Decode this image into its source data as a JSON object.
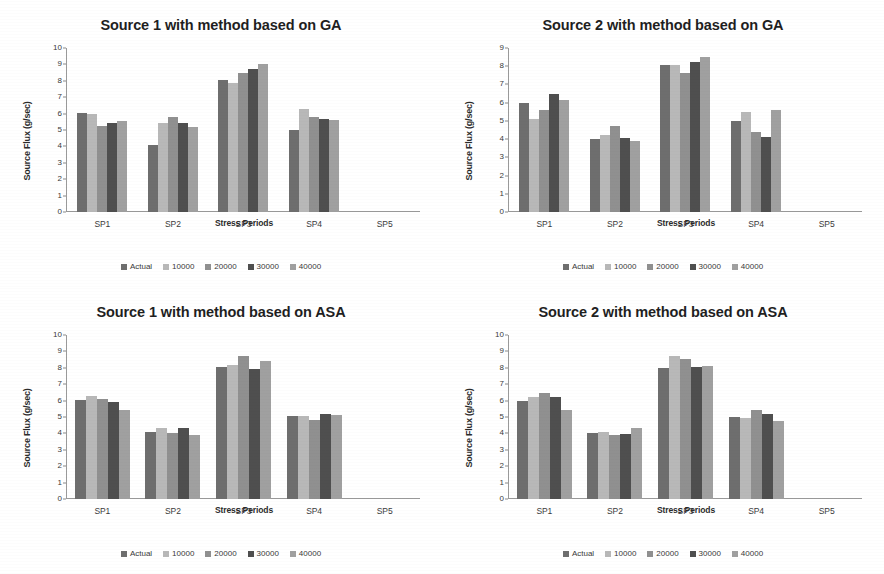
{
  "figure": {
    "series_colors": [
      "#6e6e6e",
      "#b8b8b8",
      "#909090",
      "#4f4f4f",
      "#a0a0a0"
    ],
    "series_names": [
      "Actual",
      "10000",
      "20000",
      "30000",
      "40000"
    ],
    "xlabel": "Stress Periods",
    "ylabel": "Source Flux (g/sec)",
    "categories": [
      "SP1",
      "SP2",
      "SP3",
      "SP4",
      "SP5"
    ]
  },
  "chart_data": [
    {
      "type": "bar",
      "title": "Source 1 with method based on GA",
      "xlabel": "Stress Periods",
      "ylabel": "Source Flux (g/sec)",
      "categories": [
        "SP1",
        "SP2",
        "SP3",
        "SP4",
        "SP5"
      ],
      "ylim": [
        0,
        10
      ],
      "yticks": [
        0,
        1,
        2,
        3,
        4,
        5,
        6,
        7,
        8,
        9,
        10
      ],
      "grid": false,
      "legend_position": "bottom",
      "bar_gap": true,
      "series": [
        {
          "name": "Actual",
          "values": [
            6.05,
            4.1,
            8.05,
            5.0,
            0
          ]
        },
        {
          "name": "10000",
          "values": [
            6.0,
            5.45,
            7.85,
            6.3,
            0
          ]
        },
        {
          "name": "20000",
          "values": [
            5.25,
            5.8,
            8.5,
            5.8,
            0
          ]
        },
        {
          "name": "30000",
          "values": [
            5.4,
            5.45,
            8.75,
            5.7,
            0
          ]
        },
        {
          "name": "40000",
          "values": [
            5.55,
            5.2,
            9.0,
            5.6,
            0
          ]
        }
      ]
    },
    {
      "type": "bar",
      "title": "Source 2 with method based on GA",
      "xlabel": "Stress Periods",
      "ylabel": "Source Flux (g/sec)",
      "categories": [
        "SP1",
        "SP2",
        "SP3",
        "SP4",
        "SP5"
      ],
      "ylim": [
        0,
        9
      ],
      "yticks": [
        0,
        1,
        2,
        3,
        4,
        5,
        6,
        7,
        8,
        9
      ],
      "grid": false,
      "legend_position": "bottom",
      "bar_gap": true,
      "series": [
        {
          "name": "Actual",
          "values": [
            6.0,
            4.0,
            8.05,
            5.0,
            0
          ]
        },
        {
          "name": "10000",
          "values": [
            5.1,
            4.25,
            8.05,
            5.5,
            0
          ]
        },
        {
          "name": "20000",
          "values": [
            5.6,
            4.7,
            7.65,
            4.4,
            0
          ]
        },
        {
          "name": "30000",
          "values": [
            6.45,
            4.05,
            8.25,
            4.1,
            0
          ]
        },
        {
          "name": "40000",
          "values": [
            6.15,
            3.9,
            8.5,
            5.6,
            0
          ]
        }
      ]
    },
    {
      "type": "bar",
      "title": "Source 1 with method based on ASA",
      "xlabel": "Stress Periods",
      "ylabel": "Source Flux (g/sec)",
      "categories": [
        "SP1",
        "SP2",
        "SP3",
        "SP4",
        "SP5"
      ],
      "ylim": [
        0,
        10
      ],
      "yticks": [
        0,
        1,
        2,
        3,
        4,
        5,
        6,
        7,
        8,
        9,
        10
      ],
      "grid": false,
      "legend_position": "bottom",
      "bar_gap": false,
      "series": [
        {
          "name": "Actual",
          "values": [
            6.05,
            4.1,
            8.05,
            5.05,
            0
          ]
        },
        {
          "name": "10000",
          "values": [
            6.3,
            4.3,
            8.15,
            5.05,
            0
          ]
        },
        {
          "name": "20000",
          "values": [
            6.1,
            4.05,
            8.75,
            4.8,
            0
          ]
        },
        {
          "name": "30000",
          "values": [
            5.9,
            4.3,
            7.95,
            5.2,
            0
          ]
        },
        {
          "name": "40000",
          "values": [
            5.45,
            3.9,
            8.4,
            5.1,
            0
          ]
        }
      ]
    },
    {
      "type": "bar",
      "title": "Source 2 with method based on ASA",
      "xlabel": "Stress Periods",
      "ylabel": "Source Flux (g/sec)",
      "categories": [
        "SP1",
        "SP2",
        "SP3",
        "SP4",
        "SP5"
      ],
      "ylim": [
        0,
        10
      ],
      "yticks": [
        0,
        1,
        2,
        3,
        4,
        5,
        6,
        7,
        8,
        9,
        10
      ],
      "grid": false,
      "legend_position": "bottom",
      "bar_gap": false,
      "series": [
        {
          "name": "Actual",
          "values": [
            6.0,
            4.0,
            8.0,
            5.0,
            0
          ]
        },
        {
          "name": "10000",
          "values": [
            6.2,
            4.1,
            8.7,
            4.95,
            0
          ]
        },
        {
          "name": "20000",
          "values": [
            6.45,
            3.9,
            8.55,
            5.4,
            0
          ]
        },
        {
          "name": "30000",
          "values": [
            6.25,
            3.95,
            8.05,
            5.2,
            0
          ]
        },
        {
          "name": "40000",
          "values": [
            5.4,
            4.3,
            8.1,
            4.75,
            0
          ]
        }
      ]
    }
  ]
}
